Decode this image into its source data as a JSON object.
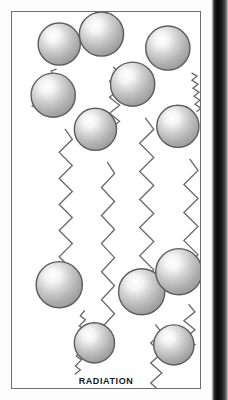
{
  "figure": {
    "caption": "RADIATION",
    "frame": {
      "x": 11,
      "y": 11,
      "width": 190,
      "height": 378,
      "border_color": "#6e6e6e",
      "background": "#ffffff"
    },
    "page_background": "#fdfdfd",
    "page_edge_band": {
      "x": 211,
      "width": 17,
      "color": "#080808"
    },
    "sphere_style": {
      "fill_light": "#ffffff",
      "fill_mid": "#c9c9c9",
      "fill_dark": "#9a9a9a",
      "outline": "#5d5d5d",
      "highlight_offset": "upper-left"
    },
    "wave_style": {
      "color": "#6b6b6b",
      "stroke_width": 1.3,
      "shape": "zigzag"
    },
    "arrow_style": {
      "color": "#3a3a3a"
    },
    "spheres": [
      {
        "id": "sphere-top-1",
        "cx": 58,
        "cy": 43,
        "r": 21
      },
      {
        "id": "sphere-top-2",
        "cx": 100,
        "cy": 33,
        "r": 22
      },
      {
        "id": "sphere-top-3",
        "cx": 166,
        "cy": 47,
        "r": 22
      },
      {
        "id": "sphere-mid-1",
        "cx": 52,
        "cy": 94,
        "r": 22
      },
      {
        "id": "sphere-mid-2",
        "cx": 131,
        "cy": 83,
        "r": 22
      },
      {
        "id": "sphere-mid-3",
        "cx": 94,
        "cy": 128,
        "r": 21
      },
      {
        "id": "sphere-mid-4",
        "cx": 176,
        "cy": 125,
        "r": 21
      },
      {
        "id": "sphere-low-1",
        "cx": 58,
        "cy": 283,
        "r": 23
      },
      {
        "id": "sphere-low-2",
        "cx": 140,
        "cy": 290,
        "r": 23
      },
      {
        "id": "sphere-low-3",
        "cx": 177,
        "cy": 270,
        "r": 23
      },
      {
        "id": "sphere-bot-1",
        "cx": 93,
        "cy": 341,
        "r": 20
      },
      {
        "id": "sphere-bot-2",
        "cx": 172,
        "cy": 343,
        "r": 20
      }
    ],
    "waves": [
      {
        "id": "wave-emit-top-1",
        "from": "sphere-top-1",
        "direction": "down-left",
        "arrow": false
      },
      {
        "id": "wave-emit-top-2",
        "from": "sphere-top-2",
        "direction": "down",
        "arrow": false
      },
      {
        "id": "wave-emit-top-3",
        "from": "sphere-top-3",
        "direction": "down-right",
        "arrow": false
      },
      {
        "id": "wave-travel-1",
        "from": "sphere-mid-1",
        "to": "sphere-low-1",
        "direction": "down",
        "arrow": true
      },
      {
        "id": "wave-travel-2",
        "from": "sphere-mid-3",
        "to": "sphere-bot-1",
        "direction": "down",
        "arrow": true
      },
      {
        "id": "wave-travel-3",
        "from": "sphere-mid-2",
        "to": "sphere-low-2",
        "direction": "down",
        "arrow": true
      },
      {
        "id": "wave-travel-4",
        "from": "sphere-mid-4",
        "to": "sphere-low-3",
        "direction": "down",
        "arrow": true
      },
      {
        "id": "wave-emit-low-1",
        "from": "sphere-low-1",
        "direction": "down-left",
        "arrow": false
      },
      {
        "id": "wave-emit-low-2",
        "from": "sphere-low-2",
        "direction": "down",
        "arrow": false
      },
      {
        "id": "wave-emit-low-3",
        "from": "sphere-low-3",
        "to": "sphere-bot-2",
        "direction": "down",
        "arrow": true
      }
    ]
  }
}
